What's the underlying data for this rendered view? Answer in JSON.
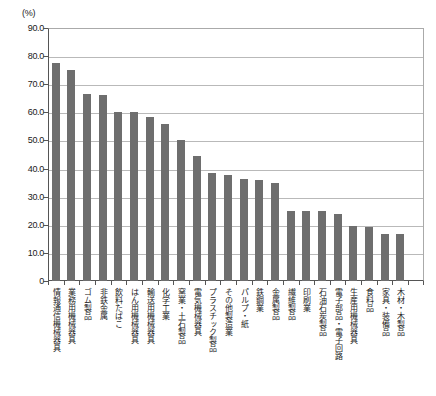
{
  "chart_data": {
    "type": "bar",
    "title": "",
    "subtitle": "",
    "unit_label": "(%)",
    "xlabel": "",
    "ylabel": "",
    "ylim": [
      0,
      90
    ],
    "ytick_values": [
      0,
      10,
      20,
      30,
      40,
      50,
      60,
      70,
      80,
      90
    ],
    "ytick_labels": [
      "0",
      "10.0",
      "20.0",
      "30.0",
      "40.0",
      "50.0",
      "60.0",
      "70.0",
      "80.0",
      "90.0"
    ],
    "grid": true,
    "legend": "none",
    "bar_color": "#6e6e6e",
    "categories": [
      "情報通信機械器具",
      "業務用機械器具",
      "ゴム製品",
      "非鉄金属",
      "飲料たばこ",
      "はん用機械器具",
      "輸送用機械器具",
      "化学工業",
      "窯業・土石製品",
      "電気機械器具",
      "プラスチック製品",
      "その他製造業",
      "パルプ・紙",
      "鉄鋼業",
      "金属製品",
      "繊維製品",
      "印刷業",
      "石油石炭製品",
      "電子部品・電子回路",
      "生産用機械器具",
      "食料品",
      "家具・装備品",
      "木材・木製品"
    ],
    "values": [
      77.7,
      75.0,
      66.5,
      66.3,
      60.2,
      60.1,
      58.2,
      55.7,
      50.0,
      44.4,
      38.6,
      37.6,
      36.2,
      36.0,
      34.9,
      24.9,
      24.8,
      24.8,
      23.7,
      19.7,
      19.3,
      16.8,
      16.8
    ]
  }
}
